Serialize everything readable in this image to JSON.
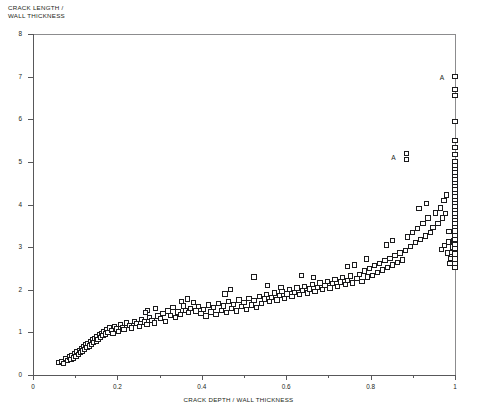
{
  "chart_data": {
    "type": "scatter",
    "title": "",
    "xlabel": "CRACK DEPTH / WALL THICKNESS",
    "ylabel": "CRACK LENGTH /\nWALL THICKNESS",
    "ylabel_line1": "CRACK LENGTH /",
    "ylabel_line2": "WALL THICKNESS",
    "xlim": [
      0,
      1
    ],
    "ylim": [
      0,
      8
    ],
    "xticks": [
      0,
      0.2,
      0.4,
      0.6,
      0.8,
      1
    ],
    "xtick_labels": [
      "0",
      "0.2",
      "0.4",
      "0.6",
      "0.8",
      "1"
    ],
    "xminor_ticks": [
      0.1,
      0.3,
      0.5,
      0.7,
      0.9
    ],
    "yticks": [
      0,
      1,
      2,
      3,
      4,
      5,
      6,
      7,
      8
    ],
    "ytick_labels": [
      "0",
      "1",
      "2",
      "3",
      "4",
      "5",
      "6",
      "7",
      "8"
    ],
    "grid": false,
    "legend": null,
    "marker": "open-square",
    "marker_color": "#1b1b1d",
    "marker_fill": "#ffffff",
    "annotations": [
      {
        "text": "A",
        "x": 0.885,
        "y": 5.12,
        "dx": -13,
        "dy": 0
      },
      {
        "text": "A",
        "x": 1.0,
        "y": 7.0,
        "dx": -13,
        "dy": 0
      }
    ],
    "points": [
      [
        0.062,
        0.3
      ],
      [
        0.068,
        0.32
      ],
      [
        0.072,
        0.27
      ],
      [
        0.078,
        0.38
      ],
      [
        0.082,
        0.34
      ],
      [
        0.086,
        0.42
      ],
      [
        0.09,
        0.36
      ],
      [
        0.092,
        0.45
      ],
      [
        0.096,
        0.4
      ],
      [
        0.098,
        0.5
      ],
      [
        0.102,
        0.44
      ],
      [
        0.104,
        0.55
      ],
      [
        0.108,
        0.48
      ],
      [
        0.11,
        0.58
      ],
      [
        0.112,
        0.52
      ],
      [
        0.116,
        0.62
      ],
      [
        0.118,
        0.56
      ],
      [
        0.12,
        0.66
      ],
      [
        0.122,
        0.6
      ],
      [
        0.126,
        0.7
      ],
      [
        0.128,
        0.64
      ],
      [
        0.13,
        0.74
      ],
      [
        0.134,
        0.68
      ],
      [
        0.136,
        0.78
      ],
      [
        0.138,
        0.72
      ],
      [
        0.142,
        0.82
      ],
      [
        0.144,
        0.76
      ],
      [
        0.146,
        0.86
      ],
      [
        0.15,
        0.8
      ],
      [
        0.152,
        0.9
      ],
      [
        0.154,
        0.84
      ],
      [
        0.158,
        0.94
      ],
      [
        0.16,
        0.88
      ],
      [
        0.162,
        0.98
      ],
      [
        0.166,
        0.92
      ],
      [
        0.168,
        1.02
      ],
      [
        0.172,
        0.96
      ],
      [
        0.174,
        1.06
      ],
      [
        0.178,
        1.0
      ],
      [
        0.182,
        1.1
      ],
      [
        0.186,
        1.04
      ],
      [
        0.19,
        0.98
      ],
      [
        0.194,
        1.14
      ],
      [
        0.198,
        1.08
      ],
      [
        0.202,
        1.02
      ],
      [
        0.208,
        1.18
      ],
      [
        0.212,
        1.12
      ],
      [
        0.216,
        1.06
      ],
      [
        0.222,
        1.22
      ],
      [
        0.228,
        1.16
      ],
      [
        0.234,
        1.1
      ],
      [
        0.24,
        1.26
      ],
      [
        0.246,
        1.2
      ],
      [
        0.252,
        1.14
      ],
      [
        0.258,
        1.3
      ],
      [
        0.264,
        1.24
      ],
      [
        0.27,
        1.18
      ],
      [
        0.276,
        1.34
      ],
      [
        0.282,
        1.28
      ],
      [
        0.288,
        1.22
      ],
      [
        0.272,
        1.52
      ],
      [
        0.266,
        1.46
      ],
      [
        0.29,
        1.56
      ],
      [
        0.296,
        1.38
      ],
      [
        0.302,
        1.32
      ],
      [
        0.308,
        1.44
      ],
      [
        0.314,
        1.26
      ],
      [
        0.32,
        1.5
      ],
      [
        0.326,
        1.4
      ],
      [
        0.332,
        1.58
      ],
      [
        0.338,
        1.34
      ],
      [
        0.344,
        1.48
      ],
      [
        0.35,
        1.42
      ],
      [
        0.356,
        1.62
      ],
      [
        0.362,
        1.52
      ],
      [
        0.368,
        1.46
      ],
      [
        0.374,
        1.56
      ],
      [
        0.38,
        1.7
      ],
      [
        0.386,
        1.5
      ],
      [
        0.392,
        1.6
      ],
      [
        0.352,
        1.72
      ],
      [
        0.366,
        1.78
      ],
      [
        0.398,
        1.44
      ],
      [
        0.404,
        1.54
      ],
      [
        0.41,
        1.38
      ],
      [
        0.416,
        1.64
      ],
      [
        0.422,
        1.48
      ],
      [
        0.428,
        1.58
      ],
      [
        0.434,
        1.42
      ],
      [
        0.44,
        1.68
      ],
      [
        0.446,
        1.52
      ],
      [
        0.452,
        1.62
      ],
      [
        0.458,
        1.46
      ],
      [
        0.464,
        1.72
      ],
      [
        0.47,
        1.56
      ],
      [
        0.476,
        1.66
      ],
      [
        0.482,
        1.5
      ],
      [
        0.488,
        1.76
      ],
      [
        0.494,
        1.6
      ],
      [
        0.5,
        1.7
      ],
      [
        0.455,
        1.9
      ],
      [
        0.468,
        2.0
      ],
      [
        0.506,
        1.54
      ],
      [
        0.512,
        1.8
      ],
      [
        0.518,
        1.64
      ],
      [
        0.524,
        1.74
      ],
      [
        0.53,
        1.58
      ],
      [
        0.536,
        1.84
      ],
      [
        0.542,
        1.68
      ],
      [
        0.548,
        1.78
      ],
      [
        0.554,
        1.88
      ],
      [
        0.56,
        1.72
      ],
      [
        0.566,
        1.82
      ],
      [
        0.572,
        1.92
      ],
      [
        0.578,
        1.76
      ],
      [
        0.584,
        1.86
      ],
      [
        0.59,
        1.96
      ],
      [
        0.596,
        1.8
      ],
      [
        0.602,
        1.9
      ],
      [
        0.608,
        2.0
      ],
      [
        0.524,
        2.3
      ],
      [
        0.556,
        2.1
      ],
      [
        0.588,
        2.05
      ],
      [
        0.614,
        1.84
      ],
      [
        0.62,
        1.94
      ],
      [
        0.626,
        2.04
      ],
      [
        0.632,
        1.88
      ],
      [
        0.638,
        1.98
      ],
      [
        0.644,
        2.08
      ],
      [
        0.65,
        1.92
      ],
      [
        0.656,
        2.02
      ],
      [
        0.662,
        2.12
      ],
      [
        0.668,
        1.96
      ],
      [
        0.674,
        2.06
      ],
      [
        0.68,
        2.16
      ],
      [
        0.636,
        2.34
      ],
      [
        0.664,
        2.28
      ],
      [
        0.686,
        2.0
      ],
      [
        0.692,
        2.1
      ],
      [
        0.698,
        2.2
      ],
      [
        0.704,
        2.04
      ],
      [
        0.71,
        2.14
      ],
      [
        0.716,
        2.24
      ],
      [
        0.722,
        2.08
      ],
      [
        0.728,
        2.18
      ],
      [
        0.734,
        2.28
      ],
      [
        0.74,
        2.12
      ],
      [
        0.746,
        2.22
      ],
      [
        0.752,
        2.32
      ],
      [
        0.758,
        2.16
      ],
      [
        0.745,
        2.55
      ],
      [
        0.762,
        2.58
      ],
      [
        0.768,
        2.26
      ],
      [
        0.774,
        2.36
      ],
      [
        0.78,
        2.2
      ],
      [
        0.786,
        2.44
      ],
      [
        0.792,
        2.3
      ],
      [
        0.798,
        2.5
      ],
      [
        0.804,
        2.34
      ],
      [
        0.81,
        2.56
      ],
      [
        0.79,
        2.72
      ],
      [
        0.816,
        2.4
      ],
      [
        0.822,
        2.62
      ],
      [
        0.828,
        2.46
      ],
      [
        0.834,
        2.68
      ],
      [
        0.84,
        2.52
      ],
      [
        0.846,
        2.74
      ],
      [
        0.852,
        2.58
      ],
      [
        0.858,
        2.8
      ],
      [
        0.864,
        2.64
      ],
      [
        0.838,
        3.05
      ],
      [
        0.852,
        3.16
      ],
      [
        0.87,
        2.86
      ],
      [
        0.876,
        2.7
      ],
      [
        0.882,
        2.92
      ],
      [
        0.885,
        5.05
      ],
      [
        0.885,
        5.2
      ],
      [
        0.888,
        3.24
      ],
      [
        0.894,
        3.02
      ],
      [
        0.9,
        3.34
      ],
      [
        0.906,
        3.1
      ],
      [
        0.912,
        3.44
      ],
      [
        0.918,
        3.18
      ],
      [
        0.924,
        3.56
      ],
      [
        0.93,
        3.26
      ],
      [
        0.936,
        3.68
      ],
      [
        0.942,
        3.34
      ],
      [
        0.915,
        3.9
      ],
      [
        0.932,
        4.02
      ],
      [
        0.948,
        3.46
      ],
      [
        0.954,
        3.8
      ],
      [
        0.96,
        3.56
      ],
      [
        0.966,
        3.92
      ],
      [
        0.97,
        3.68
      ],
      [
        0.974,
        4.1
      ],
      [
        0.978,
        3.78
      ],
      [
        0.98,
        4.22
      ],
      [
        0.968,
        2.95
      ],
      [
        0.975,
        3.04
      ],
      [
        0.982,
        2.86
      ],
      [
        0.984,
        3.12
      ],
      [
        0.986,
        3.36
      ],
      [
        0.988,
        2.62
      ],
      [
        0.99,
        2.74
      ],
      [
        0.992,
        2.88
      ],
      [
        0.994,
        3.0
      ],
      [
        0.996,
        3.14
      ],
      [
        1.0,
        2.52
      ],
      [
        1.0,
        2.62
      ],
      [
        1.0,
        2.72
      ],
      [
        1.0,
        2.84
      ],
      [
        1.0,
        2.96
      ],
      [
        1.0,
        3.06
      ],
      [
        1.0,
        3.18
      ],
      [
        1.0,
        3.28
      ],
      [
        1.0,
        3.38
      ],
      [
        1.0,
        3.48
      ],
      [
        1.0,
        3.56
      ],
      [
        1.0,
        3.64
      ],
      [
        1.0,
        3.72
      ],
      [
        1.0,
        3.8
      ],
      [
        1.0,
        3.88
      ],
      [
        1.0,
        3.96
      ],
      [
        1.0,
        4.04
      ],
      [
        1.0,
        4.12
      ],
      [
        1.0,
        4.2
      ],
      [
        1.0,
        4.28
      ],
      [
        1.0,
        4.36
      ],
      [
        1.0,
        4.44
      ],
      [
        1.0,
        4.52
      ],
      [
        1.0,
        4.6
      ],
      [
        1.0,
        4.68
      ],
      [
        1.0,
        4.76
      ],
      [
        1.0,
        4.84
      ],
      [
        1.0,
        4.92
      ],
      [
        1.0,
        5.0
      ],
      [
        1.0,
        5.18
      ],
      [
        1.0,
        5.34
      ],
      [
        1.0,
        5.5
      ],
      [
        1.0,
        5.95
      ],
      [
        1.0,
        6.55
      ],
      [
        1.0,
        6.7
      ],
      [
        1.0,
        7.0
      ]
    ]
  }
}
